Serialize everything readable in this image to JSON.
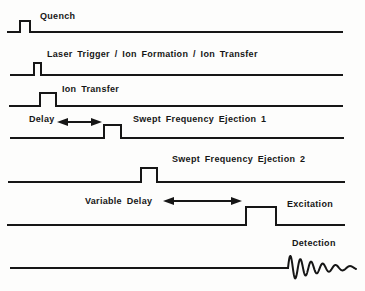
{
  "figure": {
    "background": "#fdfdfc",
    "line_color": "#161616",
    "rows": [
      {
        "id": "quench",
        "labels": [
          {
            "text": "Quench",
            "x": 40,
            "y": 11
          }
        ],
        "line": {
          "x1": 7,
          "x2": 343,
          "y": 31
        },
        "pulse": {
          "x": 19,
          "width": 12,
          "top": 20
        }
      },
      {
        "id": "laser-trigger-ion-formation-ion-transfer",
        "labels": [
          {
            "text": "Laser Trigger / Ion Formation / Ion Transfer",
            "x": 47,
            "y": 49
          }
        ],
        "line": {
          "x1": 10,
          "x2": 343,
          "y": 74
        },
        "pulse": {
          "x": 33,
          "width": 9,
          "top": 62
        }
      },
      {
        "id": "ion-transfer",
        "labels": [
          {
            "text": "Ion Transfer",
            "x": 62,
            "y": 84
          }
        ],
        "line": {
          "x1": 9,
          "x2": 343,
          "y": 105
        },
        "pulse": {
          "x": 39,
          "width": 18,
          "top": 92
        }
      },
      {
        "id": "swept-frequency-ejection-1",
        "labels": [
          {
            "text": "Delay",
            "x": 29,
            "y": 114
          },
          {
            "text": "Swept Frequency Ejection 1",
            "x": 133,
            "y": 114
          }
        ],
        "line": {
          "x1": 10,
          "x2": 344,
          "y": 137
        },
        "pulse": {
          "x": 103,
          "width": 19,
          "top": 124
        },
        "arrow": {
          "x1": 57,
          "x2": 102,
          "y": 122
        }
      },
      {
        "id": "swept-frequency-ejection-2",
        "labels": [
          {
            "text": "Swept Frequency Ejection 2",
            "x": 172,
            "y": 154
          }
        ],
        "line": {
          "x1": 8,
          "x2": 345,
          "y": 181
        },
        "pulse": {
          "x": 140,
          "width": 18,
          "top": 167
        }
      },
      {
        "id": "excitation",
        "labels": [
          {
            "text": "Variable Delay",
            "x": 85,
            "y": 196
          },
          {
            "text": "Excitation",
            "x": 287,
            "y": 199
          }
        ],
        "line": {
          "x1": 7,
          "x2": 345,
          "y": 224
        },
        "pulse": {
          "x": 245,
          "width": 32,
          "top": 206
        },
        "arrow": {
          "x1": 163,
          "x2": 242,
          "y": 201
        }
      },
      {
        "id": "detection",
        "labels": [
          {
            "text": "Detection",
            "x": 292,
            "y": 238
          }
        ],
        "line": {
          "x1": 10,
          "x2": 289,
          "y": 267
        },
        "fid": {
          "x": 288,
          "width": 68,
          "amplitude": 13,
          "decay": 2.1,
          "freq_start": 0.105,
          "freq_end": 0.06
        }
      }
    ]
  }
}
